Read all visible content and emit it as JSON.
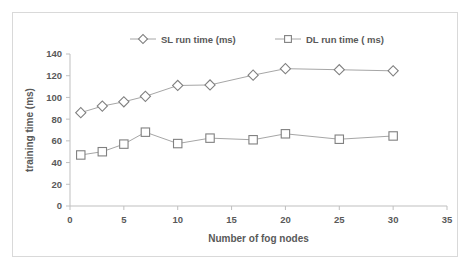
{
  "chart_data": {
    "type": "line",
    "title": "",
    "xlabel": "Number of fog nodes",
    "ylabel": "training time (ms)",
    "x": [
      1,
      3,
      5,
      7,
      10,
      13,
      17,
      20,
      25,
      30
    ],
    "xlim": [
      0,
      35
    ],
    "ylim": [
      0,
      140
    ],
    "xticks": [
      "0",
      "5",
      "10",
      "15",
      "20",
      "25",
      "30",
      "35"
    ],
    "xtick_values": [
      0,
      5,
      10,
      15,
      20,
      25,
      30,
      35
    ],
    "yticks": [
      "0",
      "20",
      "40",
      "60",
      "80",
      "100",
      "120",
      "140"
    ],
    "ytick_values": [
      0,
      20,
      40,
      60,
      80,
      100,
      120,
      140
    ],
    "grid": false,
    "legend_position": "top-center",
    "series": [
      {
        "name": "SL run time (ms)",
        "marker": "diamond",
        "values": [
          86,
          92,
          96,
          101,
          111,
          111.5,
          120.5,
          126.5,
          125.5,
          124.5
        ]
      },
      {
        "name": "DL run time ( ms)",
        "marker": "square",
        "values": [
          47,
          50,
          57,
          68,
          57.5,
          62.5,
          61,
          66.5,
          61.5,
          64.5
        ]
      }
    ]
  },
  "style": {
    "line_color": "#a6a6a6",
    "marker_stroke": "#808080",
    "text_color": "#595959",
    "axis_color": "#bfbfbf",
    "frame_color": "#d9d9d9",
    "background": "#ffffff"
  }
}
